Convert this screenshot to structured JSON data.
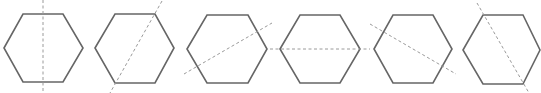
{
  "figure": {
    "colors": {
      "hexagon_stroke": "#666666",
      "dashed_line": "#9a9a9a",
      "background": "#ffffff"
    },
    "hexagons": [
      {
        "id": 1,
        "points": "4,48 23,14 63,14 83,48 63,82 23,82",
        "line": {
          "x1": 43,
          "y1": 0,
          "x2": 43,
          "y2": 93,
          "type": "vertical through edge midpoints"
        }
      },
      {
        "id": 2,
        "points": "95,48 115,14 155,14 174,48 155,83 115,83",
        "line": {
          "x1": 162,
          "y1": 1,
          "x2": 110,
          "y2": 93,
          "type": "diagonal through opposite vertices"
        }
      },
      {
        "id": 3,
        "points": "187,49 207,15 248,15 267,49 248,83 207,83",
        "line": {
          "x1": 184,
          "y1": 74,
          "x2": 272,
          "y2": 23,
          "type": "slanted through edge midpoints"
        }
      },
      {
        "id": 4,
        "points": "280,49 300,15 340,15 360,49 340,83 300,83",
        "line": {
          "x1": 270,
          "y1": 49,
          "x2": 370,
          "y2": 49,
          "type": "horizontal through opposite vertices"
        }
      },
      {
        "id": 5,
        "points": "374,49 393,15 433,15 452,49 433,83 393,83",
        "line": {
          "x1": 370,
          "y1": 24,
          "x2": 456,
          "y2": 74,
          "type": "slanted through edge midpoints"
        }
      },
      {
        "id": 6,
        "points": "463,50 483,15 523,15 540,50 523,84 483,84",
        "line": {
          "x1": 477,
          "y1": 3,
          "x2": 529,
          "y2": 93,
          "type": "diagonal through opposite vertices"
        }
      }
    ]
  }
}
